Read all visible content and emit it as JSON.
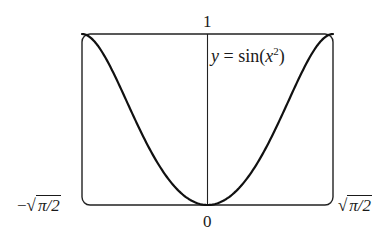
{
  "chart_data": {
    "type": "line",
    "title": "",
    "function_label": "y = sin(x²)",
    "function_label_parts": {
      "lhs": "y",
      "eq": " = ",
      "fn": "sin(",
      "var": "x",
      "exp": "2",
      "close": ")"
    },
    "xlabel": "",
    "ylabel": "",
    "xlim": [
      -1.2533,
      1.2533
    ],
    "ylim": [
      0,
      1
    ],
    "x_tick_labels": {
      "left": "−√(π/2)",
      "center": "0",
      "right": "√(π/2)"
    },
    "x_tick_label_parts": {
      "left_sign": "−",
      "radicand": "π/2",
      "radical": "√",
      "center": "0"
    },
    "y_tick_labels": {
      "top": "1"
    },
    "grid": false,
    "legend": "none",
    "series": [
      {
        "name": "y = sin(x^2)",
        "x": [
          -1.2533,
          -1.1,
          -1.0,
          -0.9,
          -0.8,
          -0.7,
          -0.6,
          -0.5,
          -0.4,
          -0.3,
          -0.2,
          -0.1,
          0,
          0.1,
          0.2,
          0.3,
          0.4,
          0.5,
          0.6,
          0.7,
          0.8,
          0.9,
          1.0,
          1.1,
          1.2533
        ],
        "values": [
          1.0,
          0.9356,
          0.8415,
          0.7243,
          0.5972,
          0.4706,
          0.3523,
          0.2474,
          0.1593,
          0.0899,
          0.04,
          0.01,
          0,
          0.01,
          0.04,
          0.0899,
          0.1593,
          0.2474,
          0.3523,
          0.4706,
          0.5972,
          0.7243,
          0.8415,
          0.9356,
          1.0
        ]
      }
    ],
    "colors": {
      "curve": "#111111",
      "frame": "#222222",
      "axis": "#222222"
    }
  }
}
